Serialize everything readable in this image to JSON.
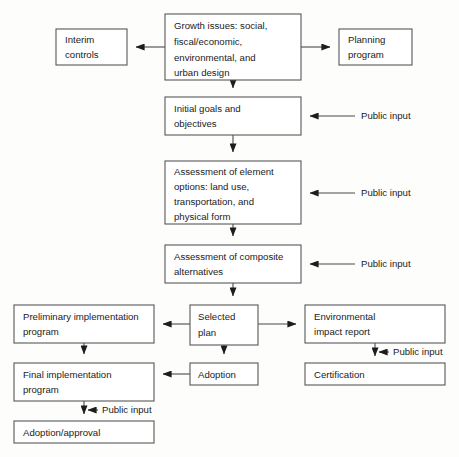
{
  "diagram": {
    "type": "flowchart",
    "background_color": "#fdfdfc",
    "box_fill_color": "#ffffff",
    "box_border_color": "#58585a",
    "arrow_color": "#4a4a4c",
    "text_color": "#1b1b1b",
    "nodes": [
      {
        "id": "growth-issues",
        "lines": [
          "Growth issues: social,",
          "fiscal/economic,",
          "environmental, and",
          "urban design"
        ],
        "x": 165,
        "y": 14,
        "w": 136,
        "h": 66
      },
      {
        "id": "interim-controls",
        "lines": [
          "Interim",
          "controls"
        ],
        "x": 56,
        "y": 29,
        "w": 71,
        "h": 36
      },
      {
        "id": "planning-program",
        "lines": [
          "Planning",
          "program"
        ],
        "x": 339,
        "y": 29,
        "w": 73,
        "h": 36
      },
      {
        "id": "initial-goals",
        "lines": [
          "Initial goals and",
          "objectives"
        ],
        "x": 165,
        "y": 97,
        "w": 136,
        "h": 38
      },
      {
        "id": "assessment-elements",
        "lines": [
          "Assessment of element",
          "options: land use,",
          "transportation, and",
          "physical form"
        ],
        "x": 165,
        "y": 161,
        "w": 136,
        "h": 63
      },
      {
        "id": "assessment-composite",
        "lines": [
          "Assessment of composite",
          "alternatives"
        ],
        "x": 165,
        "y": 245,
        "w": 136,
        "h": 38
      },
      {
        "id": "selected-plan",
        "lines": [
          "Selected",
          "plan"
        ],
        "x": 190,
        "y": 305,
        "w": 68,
        "h": 40
      },
      {
        "id": "preliminary-implementation",
        "lines": [
          "Preliminary implementation",
          "program"
        ],
        "x": 14,
        "y": 305,
        "w": 140,
        "h": 38
      },
      {
        "id": "environmental-impact-report",
        "lines": [
          "Environmental",
          "impact report"
        ],
        "x": 305,
        "y": 305,
        "w": 140,
        "h": 38
      },
      {
        "id": "final-implementation",
        "lines": [
          "Final  implementation",
          "program"
        ],
        "x": 14,
        "y": 363,
        "w": 140,
        "h": 38
      },
      {
        "id": "adoption",
        "lines": [
          "Adoption"
        ],
        "x": 190,
        "y": 363,
        "w": 68,
        "h": 22
      },
      {
        "id": "certification",
        "lines": [
          "Certification"
        ],
        "x": 305,
        "y": 363,
        "w": 140,
        "h": 22
      },
      {
        "id": "adoption-approval",
        "lines": [
          "Adoption/approval"
        ],
        "x": 14,
        "y": 421,
        "w": 140,
        "h": 22
      }
    ],
    "annotations": [
      {
        "id": "public-input-goals",
        "label": "Public input",
        "x": 361,
        "y": 116
      },
      {
        "id": "public-input-elements",
        "label": "Public input",
        "x": 361,
        "y": 193
      },
      {
        "id": "public-input-composite",
        "label": "Public input",
        "x": 361,
        "y": 264
      },
      {
        "id": "public-input-eir",
        "label": "Public input",
        "x": 393,
        "y": 352
      },
      {
        "id": "public-input-final",
        "label": "Public input",
        "x": 102,
        "y": 410
      }
    ],
    "edges": [
      {
        "id": "growth-to-interim",
        "from": "growth-issues",
        "to": "interim-controls",
        "direction": "left"
      },
      {
        "id": "growth-to-planning",
        "from": "growth-issues",
        "to": "planning-program",
        "direction": "right"
      },
      {
        "id": "growth-to-goals",
        "from": "growth-issues",
        "to": "initial-goals",
        "direction": "down"
      },
      {
        "id": "goals-to-elements",
        "from": "initial-goals",
        "to": "assessment-elements",
        "direction": "down"
      },
      {
        "id": "elements-to-composite",
        "from": "assessment-elements",
        "to": "assessment-composite",
        "direction": "down"
      },
      {
        "id": "composite-to-selected",
        "from": "assessment-composite",
        "to": "selected-plan",
        "direction": "down"
      },
      {
        "id": "selected-to-preliminary",
        "from": "selected-plan",
        "to": "preliminary-implementation",
        "direction": "left"
      },
      {
        "id": "selected-to-eir",
        "from": "selected-plan",
        "to": "environmental-impact-report",
        "direction": "right"
      },
      {
        "id": "selected-to-adoption",
        "from": "selected-plan",
        "to": "adoption",
        "direction": "down"
      },
      {
        "id": "preliminary-to-final",
        "from": "preliminary-implementation",
        "to": "final-implementation",
        "direction": "down"
      },
      {
        "id": "adoption-to-final",
        "from": "adoption",
        "to": "final-implementation",
        "direction": "left"
      },
      {
        "id": "eir-to-certification",
        "from": "environmental-impact-report",
        "to": "certification",
        "direction": "down"
      },
      {
        "id": "final-to-adoption-approval",
        "from": "final-implementation",
        "to": "adoption-approval",
        "direction": "down"
      }
    ]
  }
}
